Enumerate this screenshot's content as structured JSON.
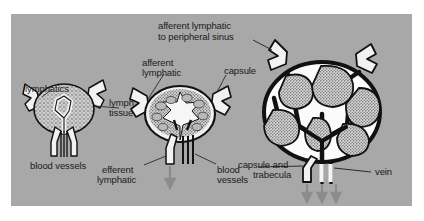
{
  "figure": {
    "panel_background_color": "#a8a8a8",
    "page_background_color": "#ffffff",
    "label_color": "#1a1a1a",
    "ink_color": "#111111",
    "tissue_fill_color": "#c9c9c9",
    "sinus_fill_color": "#f2f2f2",
    "arrow_color": "#8c8c8c"
  },
  "labels": {
    "lymphatics": "lymphatics",
    "lymph_tissue_line1": "lymph",
    "lymph_tissue_line2": "tissue",
    "blood_vessels_left": "blood vessels",
    "afferent_lymphatic_line1": "afferent",
    "afferent_lymphatic_line2": "lymphatic",
    "capsule": "capsule",
    "efferent_lymphatic_line1": "efferent",
    "efferent_lymphatic_line2": "lymphatic",
    "blood_vessels_mid_line1": "blood",
    "blood_vessels_mid_line2": "vessels",
    "afferent_peripheral_line1": "afferent lymphatic",
    "afferent_peripheral_line2": "to peripheral sinus",
    "capsule_trabecula_line1": "capsule and",
    "capsule_trabecula_line2": "trabecula",
    "vein": "vein"
  },
  "diagrams": [
    {
      "name": "simple-node",
      "position": "left",
      "structures": [
        "lymphatics",
        "lymph tissue",
        "blood vessels"
      ]
    },
    {
      "name": "intermediate-node",
      "position": "center",
      "structures": [
        "afferent lymphatic",
        "capsule",
        "efferent lymphatic",
        "blood vessels"
      ]
    },
    {
      "name": "complex-node",
      "position": "right",
      "structures": [
        "afferent lymphatic to peripheral sinus",
        "capsule and trabecula",
        "vein"
      ]
    }
  ]
}
